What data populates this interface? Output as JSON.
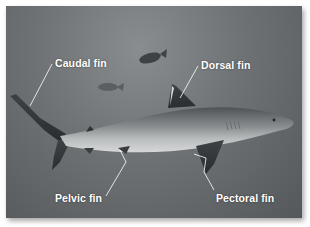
{
  "figure": {
    "labels": {
      "caudal": "Caudal fin",
      "dorsal": "Dorsal fin",
      "pelvic": "Pelvic fin",
      "pectoral": "Pectoral fin"
    },
    "colors": {
      "water": "#6f7274",
      "label_text": "#ffffff",
      "leader_line": "#ffffff"
    }
  }
}
